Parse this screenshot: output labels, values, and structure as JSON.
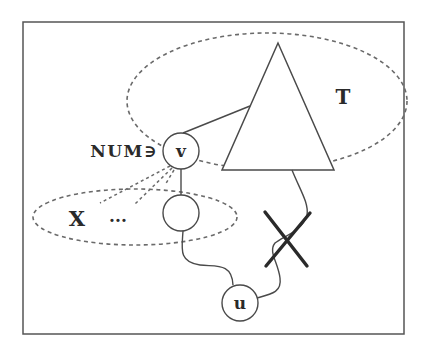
{
  "diagram": {
    "colors": {
      "background": "#ffffff",
      "stroke": "#4a4a4a",
      "dashed": "#6a6a6a",
      "cross": "#2a2a2a",
      "text": "#2a2a2a"
    },
    "frame": {
      "x": 23,
      "y": 22,
      "width": 381,
      "height": 312
    },
    "regions": {
      "tree_region": {
        "cx": 267,
        "cy": 101,
        "rx": 140,
        "ry": 68
      },
      "set_region": {
        "cx": 135,
        "cy": 217,
        "rx": 102,
        "ry": 28
      }
    },
    "tree": {
      "label": "T",
      "points": "278,43 222,170 334,170"
    },
    "nodes": {
      "v": {
        "label": "v",
        "cx": 181,
        "cy": 151,
        "r": 18
      },
      "w": {
        "label": "",
        "cx": 181,
        "cy": 213,
        "r": 18
      },
      "u": {
        "label": "u",
        "cx": 240,
        "cy": 303,
        "r": 18
      }
    },
    "labels": {
      "num_label": "NUM∋",
      "set_label": "X",
      "ellipsis": "..."
    },
    "cut_marker": "cross"
  }
}
